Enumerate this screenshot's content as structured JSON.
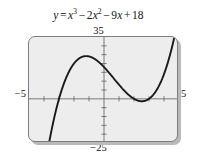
{
  "figure": {
    "caption": {
      "lhs": "y",
      "equals": "=",
      "full_text": "y = x^3 - 2x^2 - 9x + 18",
      "terms": [
        {
          "coef": "",
          "var": "x",
          "exp": "3",
          "sign": ""
        },
        {
          "coef": "2",
          "var": "x",
          "exp": "2",
          "sign": "−"
        },
        {
          "coef": "9",
          "var": "x",
          "exp": "",
          "sign": "−"
        },
        {
          "coef": "18",
          "var": "",
          "exp": "",
          "sign": "+"
        }
      ],
      "sign_minus": "−",
      "sign_plus": "+"
    },
    "window": {
      "xmin_label": "−5",
      "xmax_label": "5",
      "ymin_label": "−25",
      "ymax_label": "35"
    },
    "colors": {
      "screen_background": "#ededed",
      "screen_border": "#7d7d7d",
      "screen_shadow": "#b9b9b9",
      "axis": "#6e6e6e",
      "curve": "#1a1a1a",
      "page_background": "#ffffff",
      "text": "#141414"
    }
  },
  "chart_data": {
    "type": "line",
    "xlabel": "x",
    "ylabel": "y",
    "xlim": [
      -5,
      5
    ],
    "ylim": [
      -25,
      35
    ],
    "grid": false,
    "legend": null,
    "axes": {
      "x_axis_at_y": 0,
      "y_axis_at_x": 0,
      "x_tick_spacing": 1,
      "y_tick_spacing": 5,
      "x_ticks": [
        -4,
        -3,
        -2,
        -1,
        1,
        2,
        3,
        4
      ],
      "y_ticks": [
        -20,
        -15,
        -10,
        -5,
        5,
        10,
        15,
        20,
        25,
        30
      ]
    },
    "function": {
      "expression": "x^3 - 2x^2 - 9x + 18",
      "coefficients": {
        "a": 1,
        "b": -2,
        "c": -9,
        "d": 18
      },
      "roots": [
        -3,
        2,
        3
      ],
      "y_intercept": 18,
      "local_max": {
        "x": -1.12,
        "y": 24.06
      },
      "local_min": {
        "x": 2.69,
        "y": -0.88
      },
      "inflection": {
        "x": 0.67,
        "y": 11.59
      }
    },
    "x": [
      -3.7,
      -3.5,
      -3.25,
      -3,
      -2.75,
      -2.5,
      -2.25,
      -2,
      -1.75,
      -1.5,
      -1.25,
      -1,
      -0.75,
      -0.5,
      -0.25,
      0,
      0.25,
      0.5,
      0.75,
      1,
      1.25,
      1.5,
      1.75,
      2,
      2.25,
      2.5,
      2.75,
      3,
      3.25,
      3.5,
      3.75,
      4,
      4.2
    ],
    "values": [
      -26.7,
      -17.4,
      -8.1,
      0,
      6.9,
      12.4,
      16.7,
      20,
      22.4,
      23.6,
      24.1,
      24,
      23.3,
      22.1,
      20.4,
      18,
      15.3,
      12.1,
      8.6,
      8,
      4.1,
      3.4,
      0.6,
      0,
      -0.6,
      -1,
      -0.9,
      0,
      1.7,
      4.9,
      6.8,
      14,
      19.7
    ]
  }
}
